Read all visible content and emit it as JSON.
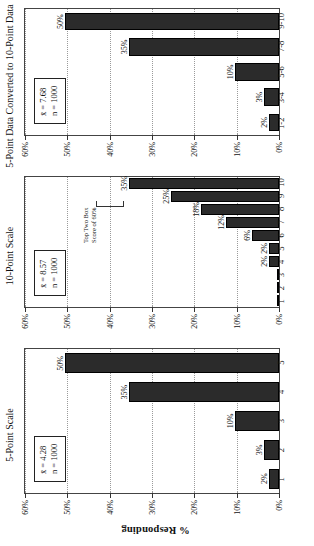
{
  "figure": {
    "y_axis_label": "% Responding",
    "y_ticks": [
      "0%",
      "10%",
      "20%",
      "30%",
      "40%",
      "50%",
      "60%"
    ],
    "y_max": 60
  },
  "chart_data": [
    {
      "type": "bar",
      "title": "5-Point Scale",
      "categories": [
        "1",
        "2",
        "3",
        "4",
        "5"
      ],
      "values": [
        2,
        3,
        10,
        35,
        50
      ],
      "value_labels": [
        "2%",
        "3%",
        "10%",
        "35%",
        "50%"
      ],
      "xlabel": "",
      "ylabel": "% Responding",
      "ylim": [
        0,
        60
      ],
      "ytick_labels": [
        "0%",
        "10%",
        "20%",
        "30%",
        "40%",
        "50%",
        "60%"
      ],
      "grid": true,
      "stats": {
        "mean_label": "x̄ = 4.28",
        "n_label": "n = 1000"
      }
    },
    {
      "type": "bar",
      "title": "10-Point Scale",
      "categories": [
        "1",
        "2",
        "3",
        "4",
        "5",
        "6",
        "7",
        "8",
        "9",
        "10"
      ],
      "values": [
        0,
        0,
        0,
        2,
        2,
        6,
        12,
        18,
        25,
        35
      ],
      "value_labels": [
        "",
        "",
        "",
        "2%",
        "2%",
        "6%",
        "12%",
        "18%",
        "25%",
        "35%"
      ],
      "xlabel": "",
      "ylabel": "% Responding",
      "ylim": [
        0,
        60
      ],
      "ytick_labels": [
        "0%",
        "10%",
        "20%",
        "30%",
        "40%",
        "50%",
        "60%"
      ],
      "grid": true,
      "annotation": "Top Two Box\nScore of 60%",
      "annotation_line1": "Top Two Box",
      "annotation_line2": "Score of 60%",
      "stats": {
        "mean_label": "x̄ = 8.57",
        "n_label": "n = 1000"
      }
    },
    {
      "type": "bar",
      "title": "5-Point Data Converted to 10-Point Data",
      "categories": [
        "1-2",
        "3-4",
        "5-6",
        "7-8",
        "9-10"
      ],
      "values": [
        2,
        3,
        10,
        35,
        50
      ],
      "value_labels": [
        "2%",
        "3%",
        "10%",
        "35%",
        "50%"
      ],
      "xlabel": "",
      "ylabel": "% Responding",
      "ylim": [
        0,
        60
      ],
      "ytick_labels": [
        "0%",
        "10%",
        "20%",
        "30%",
        "40%",
        "50%",
        "60%"
      ],
      "grid": true,
      "stats": {
        "mean_label": "x̄ = 7.68",
        "n_label": "n = 1000"
      }
    }
  ]
}
